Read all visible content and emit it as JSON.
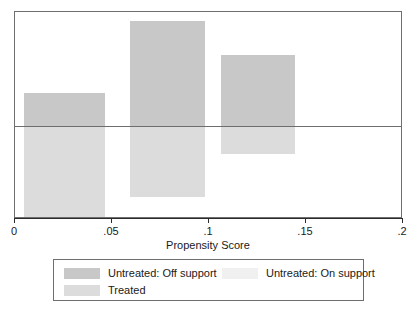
{
  "chart_data": {
    "type": "bar",
    "title": "",
    "subtitle": "",
    "xlabel": "Propensity Score",
    "ylabel": "",
    "xlim": [
      0,
      0.2
    ],
    "xticks": [
      0,
      0.05,
      0.1,
      0.15,
      0.2
    ],
    "xtick_labels": [
      "0",
      ".05",
      ".1",
      ".15",
      ".2"
    ],
    "grid": false,
    "legend_position": "below-plot",
    "orientation": "two-sided-histogram",
    "note": "Back-to-back propensity score histogram: untreated bars drawn upward, treated bars drawn downward from the zero line.",
    "series": [
      {
        "name": "Untreated: Off support",
        "color": "#c8c8c8",
        "direction": "up",
        "bins": [
          {
            "x0": 0.0045,
            "x1": 0.0465,
            "value": 0.315
          },
          {
            "x0": 0.0595,
            "x1": 0.098,
            "value": 1.0
          },
          {
            "x0": 0.106,
            "x1": 0.1445,
            "value": 0.68
          }
        ]
      },
      {
        "name": "Untreated: On support",
        "color": "#f0f0f0",
        "direction": "up",
        "bins": []
      },
      {
        "name": "Treated",
        "color": "#dcdcdc",
        "direction": "down",
        "bins": [
          {
            "x0": 0.0045,
            "x1": 0.0465,
            "value": 1.0
          },
          {
            "x0": 0.0595,
            "x1": 0.098,
            "value": 0.76
          },
          {
            "x0": 0.106,
            "x1": 0.1445,
            "value": 0.295
          }
        ]
      }
    ]
  },
  "axis": {
    "title": "Propensity Score",
    "ticks": [
      {
        "label": "0",
        "value": 0
      },
      {
        "label": ".05",
        "value": 0.05
      },
      {
        "label": ".1",
        "value": 0.1
      },
      {
        "label": ".15",
        "value": 0.15
      },
      {
        "label": ".2",
        "value": 0.2
      }
    ]
  },
  "legend": {
    "entries": [
      {
        "label": "Untreated: Off support",
        "color": "#c8c8c8"
      },
      {
        "label": "Untreated: On support",
        "color": "#f0f0f0"
      },
      {
        "label": "Treated",
        "color": "#dcdcdc"
      }
    ]
  },
  "colors": {
    "frame": "#6e6e6e",
    "axis": "#2b2b2b",
    "background": "#ffffff",
    "text": "#1a1a1a"
  }
}
